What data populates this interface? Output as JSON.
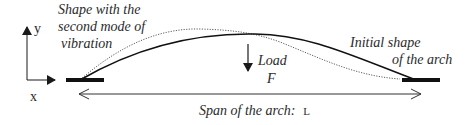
{
  "diagram": {
    "type": "arch-vibration-schematic",
    "axes": {
      "x_label": "x",
      "y_label": "y"
    },
    "labels": {
      "mode_shape_line1": "Shape with the",
      "mode_shape_line2": "second mode of",
      "mode_shape_line3": "vibration",
      "initial_shape_line1": "Initial shape",
      "initial_shape_line2": "of the arch",
      "load_label": "Load",
      "load_symbol": "F",
      "span_label": "Span of  the arch:",
      "span_symbol": "L"
    },
    "curves": [
      {
        "name": "initial-shape",
        "style": "solid"
      },
      {
        "name": "second-mode-shape",
        "style": "dotted"
      }
    ],
    "colors": {
      "stroke": "#1a1a1a",
      "support": "#111111",
      "text": "#2a2a2a"
    }
  }
}
